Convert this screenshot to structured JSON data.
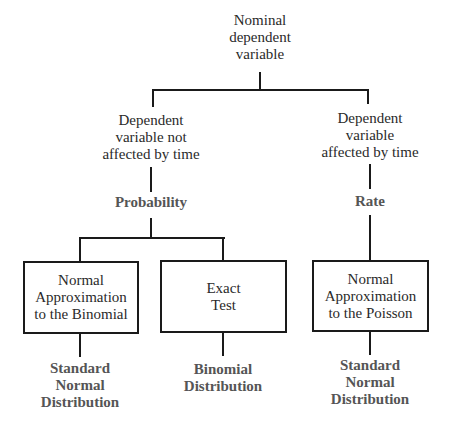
{
  "diagram": {
    "root": {
      "lines": [
        "Nominal",
        "dependent",
        "variable"
      ]
    },
    "branch_left": {
      "lines": [
        "Dependent",
        "variable not",
        "affected by time"
      ],
      "measure": "Probability",
      "children": [
        {
          "box_lines": [
            "Normal",
            "Approximation",
            "to the Binomial"
          ],
          "result_lines": [
            "Standard",
            "Normal",
            "Distribution"
          ]
        },
        {
          "box_lines": [
            "Exact",
            "Test"
          ],
          "result_lines": [
            "Binomial",
            "Distribution"
          ]
        }
      ]
    },
    "branch_right": {
      "lines": [
        "Dependent",
        "variable",
        "affected by time"
      ],
      "measure": "Rate",
      "children": [
        {
          "box_lines": [
            "Normal",
            "Approximation",
            "to the Poisson"
          ],
          "result_lines": [
            "Standard",
            "Normal",
            "Distribution"
          ]
        }
      ]
    },
    "colors": {
      "line": "#1a1a1a",
      "text": "#2a2a2a",
      "bold_text": "#555555",
      "background": "#ffffff"
    }
  }
}
